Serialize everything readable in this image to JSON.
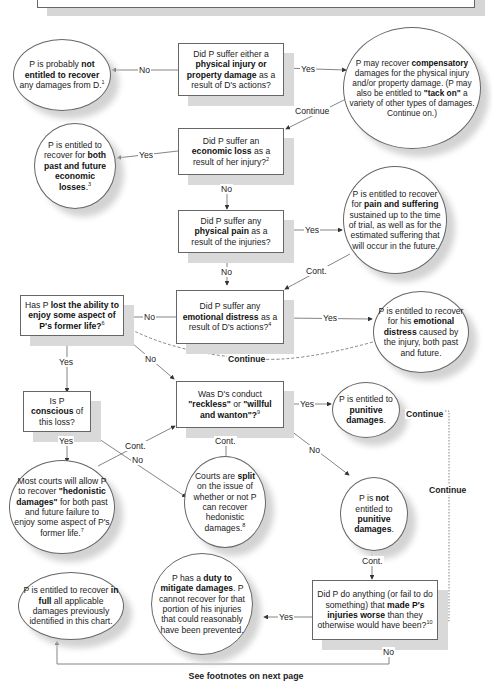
{
  "footer": "See footnotes on next page",
  "nodes": {
    "q1": {
      "pre": "Did P suffer either a ",
      "bold": "physical injury or property damage",
      "post": " as a result of D's actions?",
      "sup": ""
    },
    "not_entitled": {
      "pre": "P is probably ",
      "bold": "not entitled to recover",
      "post": " any damages from D.",
      "sup": "1"
    },
    "compensatory": {
      "pre": "P may recover ",
      "bold": "compensatory",
      "mid": " damages for the physical injury and/or property damage. (P may also be entitled to ",
      "bold2": "\"tack on\"",
      "post": " a variety of other types of damages. Continue on.)"
    },
    "q2": {
      "pre": "Did P suffer an ",
      "bold": "economic loss",
      "post": " as a result of her injury?",
      "sup": "2"
    },
    "economic": {
      "pre": "P is entitled to recover for ",
      "bold": "both past and future economic losses",
      "post": ".",
      "sup": "3"
    },
    "q3": {
      "pre": "Did P suffer any ",
      "bold": "physical pain",
      "post": " as a result of the injuries?"
    },
    "pain": {
      "pre": "P is entitled to recover for ",
      "bold": "pain and suffering",
      "post": " sustained up to the time of trial, as well as for the estimated suffering that will occur in the future."
    },
    "q4": {
      "pre": "Did P suffer any ",
      "bold": "emotional distress",
      "post": " as a result of D's actions?",
      "sup": "4"
    },
    "emotional": {
      "pre": "P is entitled to recover for his ",
      "bold": "emotional distress",
      "post": " caused by the injury, both past and future."
    },
    "q5": {
      "pre": "Has P ",
      "bold": "lost the ability to enjoy some aspect of P's former life?",
      "post": "",
      "sup": "6"
    },
    "q6": {
      "pre": "Is P ",
      "bold": "conscious",
      "post": " of this loss?"
    },
    "q7": {
      "pre": "Was D's conduct ",
      "bold": "\"reckless\"",
      "mid": " or ",
      "bold2": "\"willful and wanton\"?",
      "post": "",
      "sup": "9"
    },
    "punitive_yes": {
      "pre": "P is entitled to ",
      "bold": "punitive damages",
      "post": "."
    },
    "punitive_no": {
      "pre": "P is ",
      "bold": "not",
      "mid": " entitled to ",
      "bold2": "punitive damages",
      "post": "."
    },
    "hedonistic": {
      "pre": "Most courts will allow P to recover ",
      "bold": "\"hedonistic damages\"",
      "post": " for both past and future failure to enjoy some aspect of P's former life.",
      "sup": "7"
    },
    "split": {
      "pre": "Courts are ",
      "bold": "split",
      "post": " on the issue of whether or not P can recover hedonistic damages.",
      "sup": "8"
    },
    "q8": {
      "pre": "Did P do anything (or fail to do something) that ",
      "bold": "made P's injuries worse",
      "post": " than they otherwise would have been?",
      "sup": "10"
    },
    "mitigate": {
      "pre": "P has a ",
      "bold": "duty to mitigate damages",
      "post": ". P cannot recover for that portion of his injuries that could reasonably have been prevented."
    },
    "full": {
      "pre": "P is entitled to recover ",
      "bold": "in full",
      "post": " all applicable damages previously identified in this chart."
    }
  },
  "edge_labels": {
    "q1_no": "No",
    "q1_yes": "Yes",
    "comp_continue": "Continue",
    "q2_yes": "Yes",
    "q2_no": "No",
    "q3_yes": "Yes",
    "q3_no": "No",
    "pain_cont": "Cont.",
    "q4_no": "No",
    "q4_yes": "Yes",
    "emo_continue": "Continue",
    "q5_yes": "Yes",
    "q5_no": "No",
    "q6_yes": "Yes",
    "q6_no": "No",
    "hed_cont": "Cont.",
    "split_cont": "Cont.",
    "q7_yes": "Yes",
    "q7_no": "No",
    "pun_continue1": "Continue",
    "pun_continue2": "Continue",
    "punno_cont": "Cont.",
    "q8_yes": "Yes",
    "q8_no": "No"
  },
  "colors": {
    "line": "#555555",
    "shadow": "#d6d6d6",
    "border": "#666666"
  }
}
